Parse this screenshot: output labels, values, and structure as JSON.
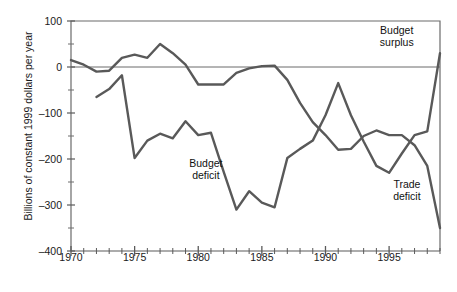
{
  "chart_data": {
    "type": "line",
    "title": "",
    "xlabel": "",
    "ylabel": "Billions of constant 1999 dollars per year",
    "xlim": [
      1970,
      1999
    ],
    "ylim": [
      -400,
      100
    ],
    "yticks": [
      100,
      0,
      -100,
      -200,
      -300,
      -400
    ],
    "ytick_labels": [
      "100",
      "0",
      "–100",
      "–200",
      "–300",
      "–400"
    ],
    "yminor_step": 50,
    "xticks": [
      1970,
      1975,
      1980,
      1985,
      1990,
      1995
    ],
    "xtick_labels": [
      "1970",
      "1975",
      "1980",
      "1985",
      "1990",
      "1995"
    ],
    "xminor_step": 1,
    "grid": false,
    "legend": "annotations",
    "zero_line": true,
    "annotations": [
      {
        "name": "budget-surplus-label",
        "text_line1": "Budget",
        "text_line2": "surplus",
        "x": 1995.6,
        "y": 68
      },
      {
        "name": "budget-deficit-label",
        "text_line1": "Budget",
        "text_line2": "deficit",
        "x": 1980.6,
        "y": -222
      },
      {
        "name": "trade-deficit-label",
        "text_line1": "Trade",
        "text_line2": "deficit",
        "x": 1996.4,
        "y": -268
      }
    ],
    "series": [
      {
        "name": "Trade balance",
        "color": "#595959",
        "x": [
          1970,
          1971,
          1972,
          1973,
          1974,
          1975,
          1976,
          1977,
          1978,
          1979,
          1980,
          1981,
          1982,
          1983,
          1984,
          1985,
          1986,
          1987,
          1988,
          1989,
          1990,
          1991,
          1992,
          1993,
          1994,
          1995,
          1996,
          1997,
          1998,
          1999
        ],
        "y": [
          15,
          5,
          -10,
          -8,
          20,
          27,
          20,
          50,
          30,
          5,
          -38,
          -38,
          -38,
          -13,
          -3,
          2,
          3,
          -28,
          -78,
          -120,
          -148,
          -180,
          -178,
          -150,
          -138,
          -148,
          -148,
          -170,
          -215,
          -350
        ]
      },
      {
        "name": "Budget balance",
        "color": "#595959",
        "x": [
          1972,
          1973,
          1974,
          1975,
          1976,
          1977,
          1978,
          1979,
          1980,
          1981,
          1982,
          1983,
          1984,
          1985,
          1986,
          1987,
          1988,
          1989,
          1990,
          1991,
          1992,
          1993,
          1994,
          1995,
          1996,
          1997,
          1998,
          1999
        ],
        "y": [
          -65,
          -48,
          -18,
          -198,
          -160,
          -145,
          -155,
          -118,
          -148,
          -143,
          -228,
          -310,
          -270,
          -295,
          -305,
          -198,
          -178,
          -160,
          -105,
          -35,
          -105,
          -162,
          -215,
          -230,
          -188,
          -148,
          -140,
          30
        ]
      }
    ]
  }
}
